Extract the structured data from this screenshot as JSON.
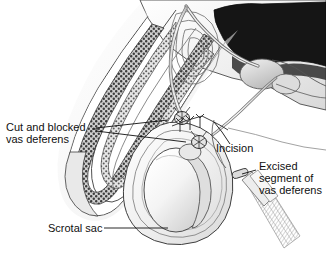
{
  "figure": {
    "background_color": "#ffffff",
    "ink_color": "#101010",
    "style": "grayscale medical line illustration"
  },
  "labels": {
    "cut_blocked": {
      "line1": "Cut and blocked",
      "line2": "vas deferens"
    },
    "incision": {
      "line1": "Incision"
    },
    "excised": {
      "line1": "Excised",
      "line2": "segment of",
      "line3": "vas deferens"
    },
    "scrotal": {
      "line1": "Scrotal sac"
    }
  },
  "anatomy": {
    "parts": [
      "penis-shaft",
      "corpus-cavernosum-stipple",
      "urethra",
      "testis",
      "epididymis",
      "scrotal-sac",
      "vas-deferens-tube",
      "pelvic-cavity",
      "prostate",
      "bladder"
    ],
    "fill_light": "#f2f2f2",
    "fill_mid": "#c9c9c9",
    "fill_dark": "#2a2a2a",
    "stipple_tone": "#6a6a6a"
  },
  "surgical": {
    "suture_count": 3,
    "ligated_ends": 2,
    "instrument": "forceps",
    "instrument_holds": "excised segment of vas deferens"
  }
}
